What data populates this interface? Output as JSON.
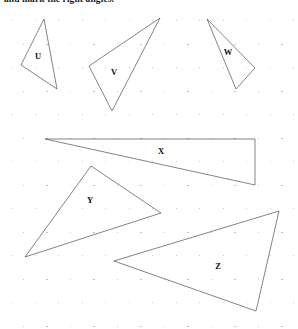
{
  "page": {
    "width": 298,
    "height": 329,
    "background_color": "#ffffff"
  },
  "heading": {
    "text": "and mark the right angles.",
    "clipped_at_top": true,
    "color": "#1a1a1a"
  },
  "grid": {
    "type": "dot-grid",
    "dot_color": "#b9b9bd",
    "spacing_x": 23.5,
    "spacing_y": 23.5,
    "origin_x": 11,
    "origin_y": 20,
    "columns": 13,
    "rows": 14,
    "stagger_offset_x": 11.75
  },
  "style": {
    "stroke_color": "#5a5a62",
    "stroke_width": 0.75,
    "label_color": "#111111"
  },
  "shapes": [
    {
      "label": "U",
      "type": "triangle",
      "points": "44,19 21,65 57,89",
      "label_x": 38,
      "label_y": 56
    },
    {
      "label": "V",
      "type": "triangle",
      "points": "160,18 89,66 112,111",
      "label_x": 114,
      "label_y": 72
    },
    {
      "label": "W",
      "type": "triangle",
      "points": "207,19 255,68 236,89",
      "label_x": 228,
      "label_y": 52
    },
    {
      "label": "X",
      "type": "triangle",
      "points": "45,139 255,139 255,185",
      "label_x": 161,
      "label_y": 151
    },
    {
      "label": "Y",
      "type": "triangle",
      "points": "91,166 161,213 25,257",
      "label_x": 90,
      "label_y": 200
    },
    {
      "label": "Z",
      "type": "triangle",
      "points": "279,211 256,311 114,261",
      "label_x": 218,
      "label_y": 266
    }
  ]
}
